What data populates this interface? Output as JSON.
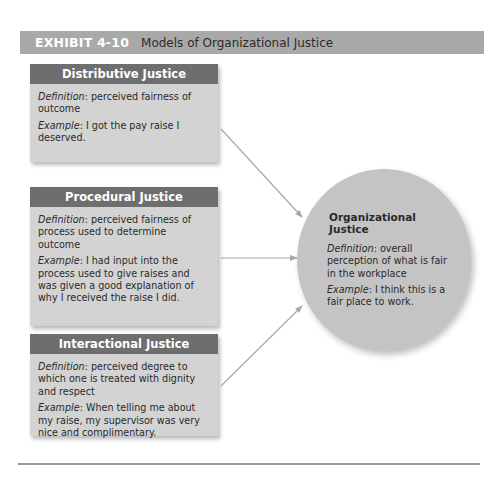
{
  "exhibit": {
    "number": "EXHIBIT 4-10",
    "title": "Models of Organizational Justice"
  },
  "boxes": [
    {
      "title": "Distributive Justice",
      "definition_label": "Definition",
      "definition_text": ": perceived fairness of outcome",
      "example_label": "Example",
      "example_text": ": I got the pay raise I deserved."
    },
    {
      "title": "Procedural Justice",
      "definition_label": "Definition",
      "definition_text": ": perceived fairness of process used to determine outcome",
      "example_label": "Example",
      "example_text": ": I had input into the process used to give raises and was given a good explanation of why I received the raise I did."
    },
    {
      "title": "Interactional Justice",
      "definition_label": "Definition",
      "definition_text": ": perceived degree to which one is treated with dignity and respect",
      "example_label": "Example",
      "example_text": ": When telling me about my raise, my supervisor was very nice and complimentary."
    }
  ],
  "outcome": {
    "title": "Organizational Justice",
    "definition_label": "Definition",
    "definition_text": ": overall perception of what is fair in the workplace",
    "example_label": "Example",
    "example_text": ": I think this is a fair place to work."
  },
  "colors": {
    "header_bar": "#a9a9a9",
    "box_header": "#6e6e6e",
    "box_body": "#d3d3d3",
    "circle": "#c4c4c4",
    "arrow": "#a8a8a8"
  }
}
